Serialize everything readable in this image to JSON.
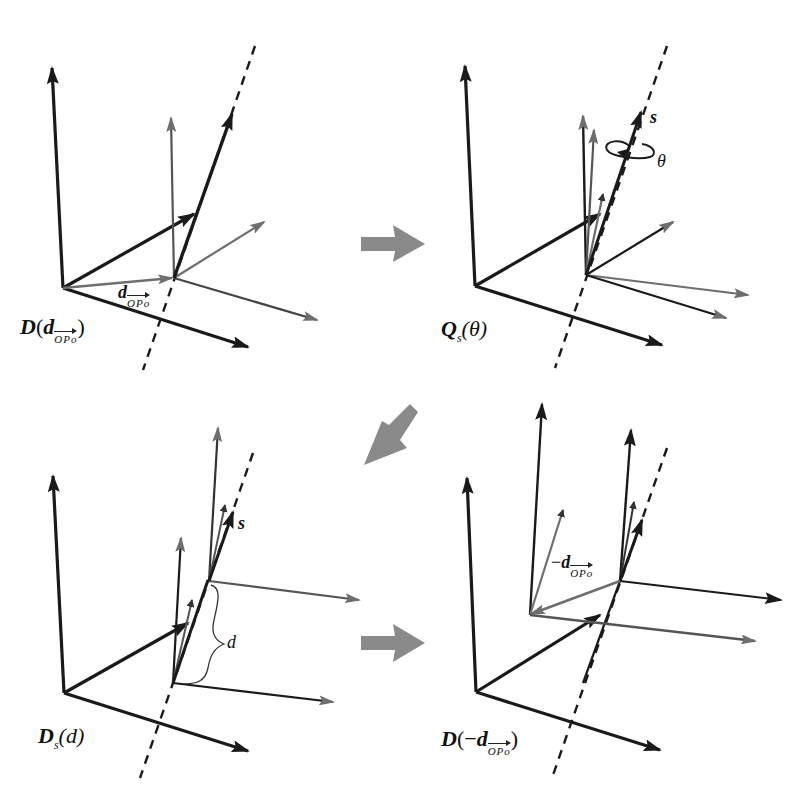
{
  "figure": {
    "panels": [
      {
        "id": "panel-1",
        "label_main": "D",
        "label_open": "(",
        "label_var": "d",
        "label_sub": "OPo",
        "label_close": ")",
        "inline_labels": [
          {
            "var": "d",
            "sub": "OPo"
          }
        ],
        "description": "Translation by d_OPo"
      },
      {
        "id": "panel-2",
        "label_main": "Q",
        "label_sub": "s",
        "label_arg": "(θ)",
        "inline_labels": [
          {
            "text": "s"
          },
          {
            "text": "θ"
          }
        ],
        "description": "Rotation about screw axis s by θ"
      },
      {
        "id": "panel-3",
        "label_main": "D",
        "label_sub": "s",
        "label_arg": "(d)",
        "inline_labels": [
          {
            "text": "s"
          },
          {
            "text": "d"
          }
        ],
        "description": "Translation along s by d"
      },
      {
        "id": "panel-4",
        "label_main": "D",
        "label_open": "(",
        "label_neg": "−",
        "label_var": "d",
        "label_sub": "OPo",
        "label_close": ")",
        "inline_labels": [
          {
            "prefix": "−",
            "var": "d",
            "sub": "OPo"
          }
        ],
        "description": "Translation back by −d_OPo"
      }
    ],
    "flow_arrows": [
      {
        "from": "panel-1",
        "to": "panel-2",
        "direction": "right"
      },
      {
        "from": "panel-2",
        "to": "panel-3",
        "direction": "down-left"
      },
      {
        "from": "panel-3",
        "to": "panel-4",
        "direction": "right"
      }
    ],
    "colors": {
      "frame_dark": "#1a1a1a",
      "frame_gray": "#6e6e6e",
      "flow_arrow": "#8a8a8a",
      "background": "#ffffff"
    }
  }
}
